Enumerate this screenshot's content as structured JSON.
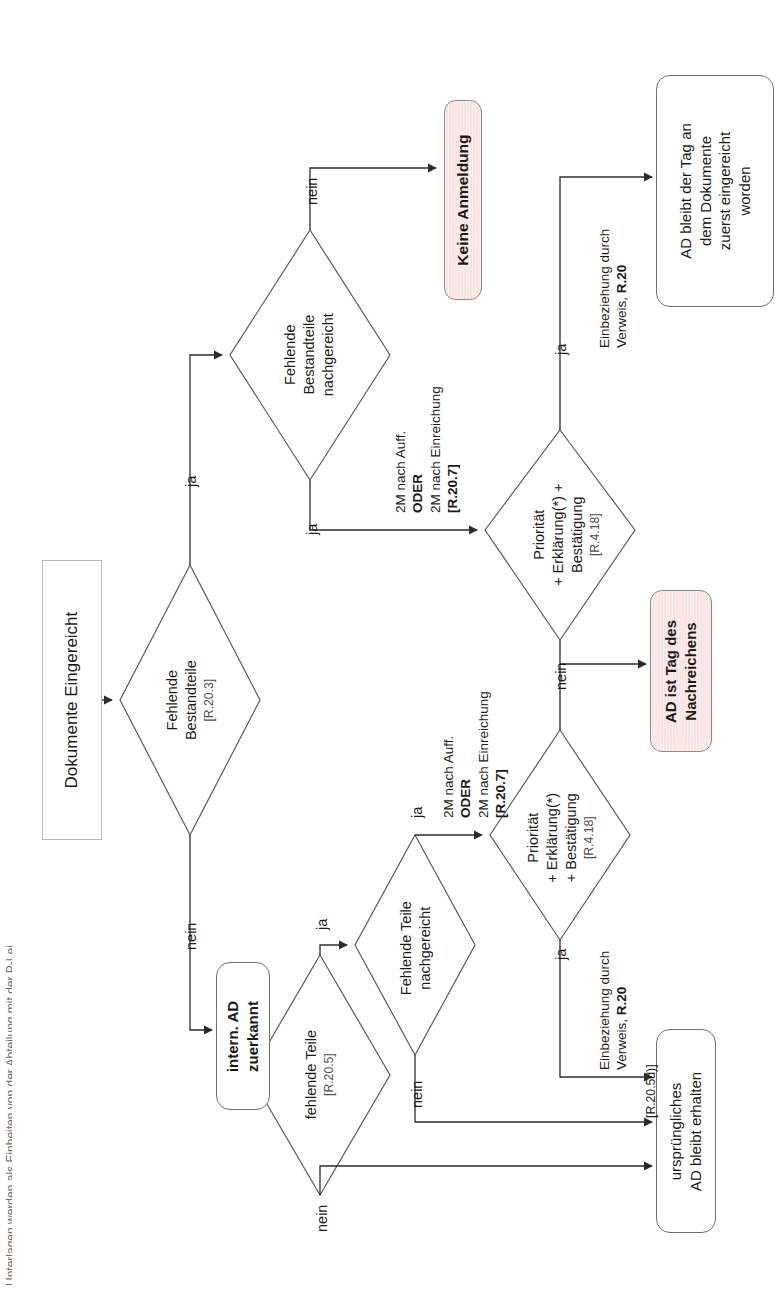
{
  "document": {
    "title": "Dokumente Eingereicht",
    "language": "de",
    "orientation": "rotated-90-ccw",
    "edge_caption": "Unterlagen werden als Einheiten von der Abteilung mit der P-Lei"
  },
  "nodes": {
    "start": {
      "id": "start",
      "label": "Dokumente Eingereicht",
      "shape": "sharp-box"
    },
    "d_fehlende_bestandteile": {
      "id": "d1",
      "label": "Fehlende\nBestandteile",
      "line1": "Fehlende",
      "line2": "Bestandteile",
      "ref": "[R.20.3]",
      "shape": "diamond"
    },
    "d_bestandteile_nachgereicht": {
      "id": "d2",
      "line1": "Fehlende",
      "line2": "Bestandteile",
      "line3": "nachgereicht",
      "shape": "diamond"
    },
    "keine_anmeldung": {
      "id": "n3",
      "label": "Keine Anmeldung",
      "shape": "pink-box"
    },
    "d_prioritaet_oben": {
      "id": "d3",
      "line1": "Priorität",
      "line2": "+ Erklärung(*) +",
      "line3": "Bestätigung",
      "ref": "[R.4.18]",
      "shape": "diamond"
    },
    "ad_bleibt_tag": {
      "id": "n4",
      "line1": "AD bleibt der Tag an",
      "line2": "dem Dokumente",
      "line3": "zuerst eingereicht",
      "line4": "worden",
      "shape": "rounded-box"
    },
    "ad_ist_tag_nachreichens": {
      "id": "n5",
      "line1": "AD ist Tag des",
      "line2": "Nachreichens",
      "shape": "pink-box"
    },
    "intern_ad_zuerkannt": {
      "id": "n6",
      "line1": "intern. AD",
      "line2": "zuerkannt",
      "shape": "rounded-box-bold"
    },
    "d_fehlende_teile": {
      "id": "d4",
      "line1": "fehlende Teile",
      "ref": "[R.20.5]",
      "shape": "diamond"
    },
    "d_teile_nachgereicht": {
      "id": "d5",
      "line1": "Fehlende Teile",
      "line2": "nachgereicht",
      "shape": "diamond"
    },
    "d_prioritaet_unten": {
      "id": "d6",
      "line1": "Priorität",
      "line2": "+ Erklärung(*)",
      "line3": "+ Bestätigung",
      "ref": "[R.4.18]",
      "shape": "diamond"
    },
    "urspruengliches_ad": {
      "id": "n7",
      "line1": "ursprüngliches",
      "line2": "AD bleibt erhalten",
      "shape": "rounded-box"
    }
  },
  "edge_labels": {
    "ja": "ja",
    "nein": "nein",
    "frist_oben": {
      "line1": "2M nach Auff.",
      "line2": "ODER",
      "line3": "2M nach Einreichung",
      "ref": "[R.20.7]"
    },
    "frist_unten": {
      "line1": "2M nach Auff.",
      "line2": "ODER",
      "line3": "2M nach Einreichung",
      "ref": "[R.20.7]"
    },
    "einbeziehung_oben": {
      "line1": "Einbeziehung durch",
      "line2_prefix": "Verweis, ",
      "line2_bold": "R.20"
    },
    "einbeziehung_unten": {
      "line1": "Einbeziehung durch",
      "line2_prefix": "Verweis, ",
      "line2_bold": "R.20"
    },
    "ref_r205d": "[R.20.5d)]"
  },
  "colors": {
    "pink_fill": "#fae3e1",
    "stroke": "#4d4d4d",
    "box_border": "#6f6f6f",
    "text": "#1a1a1a",
    "ref_text": "#4d4d4d"
  }
}
